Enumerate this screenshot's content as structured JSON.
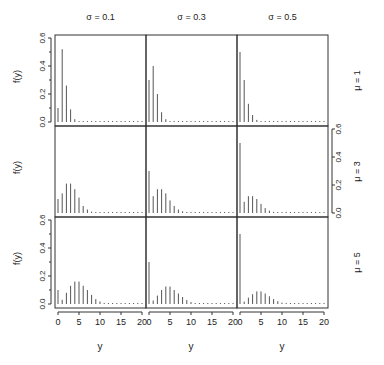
{
  "chart_data": {
    "type": "bar",
    "subtype": "lattice-spike-plot",
    "title": "",
    "xlabel": "y",
    "ylabel": "f(y)",
    "xlim": [
      0,
      20
    ],
    "ylim": [
      0,
      0.6
    ],
    "x_ticks": [
      "0",
      "5",
      "10",
      "15",
      "20"
    ],
    "y_ticks": [
      "0.0",
      "0.2",
      "0.4",
      "0.6"
    ],
    "grid": false,
    "column_headers": [
      "σ = 0.1",
      "σ = 0.3",
      "σ = 0.5"
    ],
    "row_headers": [
      "μ = 1",
      "μ = 3",
      "μ = 5"
    ],
    "x": [
      0,
      1,
      2,
      3,
      4,
      5,
      6,
      7,
      8,
      9,
      10,
      11,
      12,
      13,
      14,
      15,
      16,
      17,
      18,
      19,
      20
    ],
    "panels": [
      {
        "row": 0,
        "col": 0,
        "mu": 1,
        "sigma": 0.1,
        "values": [
          0.1,
          0.52,
          0.26,
          0.09,
          0.02,
          0.005,
          0.002,
          0.001,
          0.001,
          0.001,
          0.001,
          0.001,
          0.001,
          0.001,
          0.001,
          0.001,
          0.001,
          0.001,
          0.001,
          0.001,
          0.001
        ]
      },
      {
        "row": 0,
        "col": 1,
        "mu": 1,
        "sigma": 0.3,
        "values": [
          0.3,
          0.4,
          0.2,
          0.07,
          0.02,
          0.005,
          0.002,
          0.001,
          0.001,
          0.001,
          0.001,
          0.001,
          0.001,
          0.001,
          0.001,
          0.001,
          0.001,
          0.001,
          0.001,
          0.001,
          0.001
        ]
      },
      {
        "row": 0,
        "col": 2,
        "mu": 1,
        "sigma": 0.5,
        "values": [
          0.5,
          0.3,
          0.13,
          0.05,
          0.015,
          0.005,
          0.002,
          0.001,
          0.001,
          0.001,
          0.001,
          0.001,
          0.001,
          0.001,
          0.001,
          0.001,
          0.001,
          0.001,
          0.001,
          0.001,
          0.001
        ]
      },
      {
        "row": 1,
        "col": 0,
        "mu": 3,
        "sigma": 0.1,
        "values": [
          0.1,
          0.14,
          0.21,
          0.21,
          0.17,
          0.11,
          0.05,
          0.025,
          0.01,
          0.004,
          0.002,
          0.001,
          0.001,
          0.001,
          0.001,
          0.001,
          0.001,
          0.001,
          0.001,
          0.001,
          0.001
        ]
      },
      {
        "row": 1,
        "col": 1,
        "mu": 3,
        "sigma": 0.3,
        "values": [
          0.3,
          0.12,
          0.17,
          0.17,
          0.14,
          0.09,
          0.05,
          0.025,
          0.012,
          0.005,
          0.002,
          0.001,
          0.001,
          0.001,
          0.001,
          0.001,
          0.001,
          0.001,
          0.001,
          0.001,
          0.001
        ]
      },
      {
        "row": 1,
        "col": 2,
        "mu": 3,
        "sigma": 0.5,
        "values": [
          0.5,
          0.08,
          0.12,
          0.12,
          0.1,
          0.065,
          0.035,
          0.017,
          0.008,
          0.003,
          0.001,
          0.001,
          0.001,
          0.001,
          0.001,
          0.001,
          0.001,
          0.001,
          0.001,
          0.001,
          0.001
        ]
      },
      {
        "row": 2,
        "col": 0,
        "mu": 5,
        "sigma": 0.1,
        "values": [
          0.1,
          0.03,
          0.08,
          0.13,
          0.16,
          0.16,
          0.13,
          0.1,
          0.065,
          0.035,
          0.018,
          0.008,
          0.003,
          0.001,
          0.001,
          0.001,
          0.001,
          0.001,
          0.001,
          0.001,
          0.001
        ]
      },
      {
        "row": 2,
        "col": 1,
        "mu": 5,
        "sigma": 0.3,
        "values": [
          0.3,
          0.025,
          0.06,
          0.1,
          0.125,
          0.125,
          0.1,
          0.075,
          0.05,
          0.028,
          0.014,
          0.006,
          0.002,
          0.001,
          0.001,
          0.001,
          0.001,
          0.001,
          0.001,
          0.001,
          0.001
        ]
      },
      {
        "row": 2,
        "col": 2,
        "mu": 5,
        "sigma": 0.5,
        "values": [
          0.5,
          0.017,
          0.045,
          0.07,
          0.09,
          0.09,
          0.075,
          0.055,
          0.035,
          0.02,
          0.01,
          0.004,
          0.002,
          0.001,
          0.001,
          0.001,
          0.001,
          0.001,
          0.001,
          0.001,
          0.001
        ]
      }
    ]
  }
}
